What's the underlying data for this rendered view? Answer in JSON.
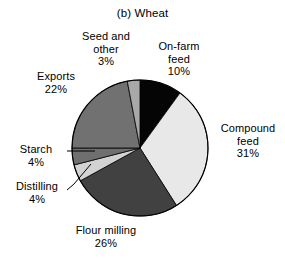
{
  "chart_data": {
    "type": "pie",
    "title": "(b) Wheat",
    "xlabel": "",
    "ylabel": "",
    "legend": "none",
    "grid": false,
    "labels_outside": true,
    "start_angle_deg": 0,
    "direction": "clockwise",
    "categories": [
      "On-farm feed",
      "Compound feed",
      "Flour milling",
      "Distilling",
      "Starch",
      "Exports",
      "Seed and other"
    ],
    "values": [
      10,
      31,
      26,
      4,
      4,
      22,
      3
    ],
    "units": "%",
    "slices": [
      {
        "name": "on-farm-feed",
        "label": "On-farm feed",
        "label_line1": "On-farm",
        "label_line2": "feed",
        "value": 10,
        "value_text": "10%",
        "color": "#050505",
        "start_deg": 0,
        "end_deg": 36
      },
      {
        "name": "compound-feed",
        "label": "Compound feed",
        "label_line1": "Compound",
        "label_line2": "feed",
        "value": 31,
        "value_text": "31%",
        "color": "#e8e8e8",
        "start_deg": 36,
        "end_deg": 147.6
      },
      {
        "name": "flour-milling",
        "label": "Flour milling",
        "label_line1": "Flour milling",
        "label_line2": "",
        "value": 26,
        "value_text": "26%",
        "color": "#414141",
        "start_deg": 147.6,
        "end_deg": 241.2
      },
      {
        "name": "distilling",
        "label": "Distilling",
        "label_line1": "Distilling",
        "label_line2": "",
        "value": 4,
        "value_text": "4%",
        "color": "#d2d2d2",
        "start_deg": 241.2,
        "end_deg": 255.6
      },
      {
        "name": "starch",
        "label": "Starch",
        "label_line1": "Starch",
        "label_line2": "",
        "value": 4,
        "value_text": "4%",
        "color": "#6f6f6f",
        "start_deg": 255.6,
        "end_deg": 270
      },
      {
        "name": "exports",
        "label": "Exports",
        "label_line1": "Exports",
        "label_line2": "",
        "value": 22,
        "value_text": "22%",
        "color": "#717171",
        "start_deg": 270,
        "end_deg": 349.2
      },
      {
        "name": "seed-and-other",
        "label": "Seed and other",
        "label_line1": "Seed and",
        "label_line2": "other",
        "value": 3,
        "value_text": "3%",
        "color": "#a8a8a8",
        "start_deg": 349.2,
        "end_deg": 360
      }
    ],
    "geometry": {
      "center_x": 140,
      "center_y": 148,
      "radius": 68,
      "outline_color": "#000000"
    }
  }
}
